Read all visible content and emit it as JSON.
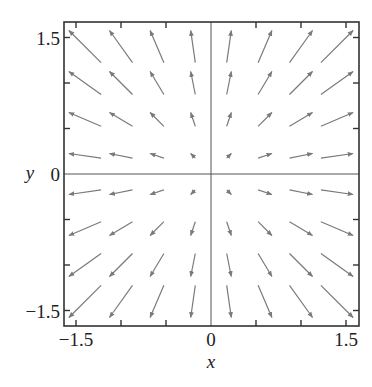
{
  "chart_data": {
    "type": "quiver",
    "title": "",
    "xlabel": "x",
    "ylabel": "y",
    "xlim": [
      -1.5,
      1.5
    ],
    "ylim": [
      -1.5,
      1.5
    ],
    "grid": false,
    "zero_lines": true,
    "x_tick_labels": [
      "−1.5",
      "0",
      "1.5"
    ],
    "x_tick_label_values": [
      -1.5,
      0,
      1.5
    ],
    "y_tick_labels": [
      "1.5",
      "0",
      "−1.5"
    ],
    "y_tick_label_values": [
      1.5,
      0,
      -1.5
    ],
    "minor_tick_values": [
      -1.5,
      -1.0,
      -0.5,
      0.5,
      1.0,
      1.5
    ],
    "vector_field": "F(x, y) = (x, y)",
    "grid_x": [
      -1.4,
      -1.0,
      -0.6,
      -0.2,
      0.2,
      0.6,
      1.0,
      1.4
    ],
    "grid_y": [
      -1.4,
      -1.0,
      -0.6,
      -0.2,
      0.2,
      0.6,
      1.0,
      1.4
    ],
    "arrow_color": "#7a7a7a",
    "frame_color": "#333333"
  }
}
